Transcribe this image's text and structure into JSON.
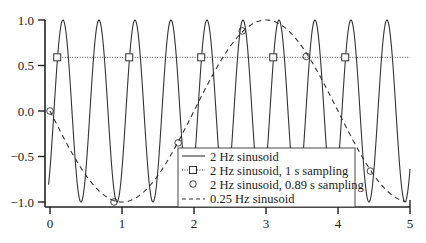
{
  "chart_data": {
    "type": "line",
    "title": "",
    "xlabel": "",
    "ylabel": "",
    "xlim": [
      0,
      5
    ],
    "ylim": [
      -1.0,
      1.0
    ],
    "grid": false,
    "legend_position": "lower right",
    "x_ticks": [
      "0",
      "1",
      "2",
      "3",
      "4",
      "5"
    ],
    "y_ticks": [
      "1.0",
      "0.5",
      "0.0",
      "-0.5",
      "-1.0"
    ],
    "series": [
      {
        "name": "2 Hz sinusoid",
        "style": "solid",
        "function": "cos(2*pi*2*t + phase)",
        "frequency_hz": 2,
        "amplitude": 1.0
      },
      {
        "name": "2 Hz sinusoid, 1 s sampling",
        "style": "dotted-square",
        "x": [
          0.1,
          1.1,
          2.1,
          3.1,
          4.1
        ],
        "values": [
          0.59,
          0.59,
          0.59,
          0.59,
          0.59
        ]
      },
      {
        "name": "2 Hz sinusoid, 0.89 s sampling",
        "style": "circle",
        "x": [
          0,
          0.89,
          1.78,
          2.67,
          3.56,
          4.45
        ],
        "values": [
          0.0,
          -1.0,
          -0.35,
          0.88,
          0.6,
          -0.66
        ]
      },
      {
        "name": "0.25 Hz sinusoid",
        "style": "dashed",
        "function": "sin(2*pi*0.25*t)",
        "frequency_hz": 0.25,
        "amplitude": 1.0
      }
    ]
  },
  "legend": {
    "items": [
      {
        "label": "2 Hz sinusoid"
      },
      {
        "label": "2 Hz sinusoid, 1 s sampling"
      },
      {
        "label": "2 Hz sinusoid, 0.89 s sampling"
      },
      {
        "label": "0.25 Hz sinusoid"
      }
    ]
  },
  "axes": {
    "x_ticks": [
      "0",
      "1",
      "2",
      "3",
      "4",
      "5"
    ],
    "y_ticks": [
      "1.0",
      "0.5",
      "0.0",
      "−0.5",
      "−1.0"
    ]
  },
  "colors": {
    "line": "#333333",
    "background": "#ffffff"
  }
}
